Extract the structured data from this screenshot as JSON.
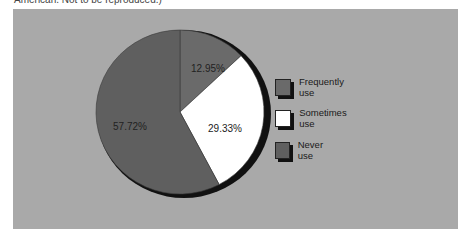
{
  "caption": "American. Not to be reproduced.)",
  "colors": {
    "panel_bg": "#a9a9a9",
    "frequently": "#6a6a6a",
    "sometimes": "#ffffff",
    "never": "#5f5f5f",
    "shadow": "#111111"
  },
  "chart_data": {
    "type": "pie",
    "title": "",
    "categories": [
      "Frequently use",
      "Sometimes use",
      "Never use"
    ],
    "values": [
      12.95,
      29.33,
      57.72
    ],
    "labels": [
      "12.95%",
      "29.33%",
      "57.72%"
    ],
    "legend_position": "right"
  },
  "legend": {
    "items": [
      {
        "label": "Frequently use",
        "swatch": "#6a6a6a"
      },
      {
        "label": "Sometimes use",
        "swatch": "#ffffff"
      },
      {
        "label": "Never use",
        "swatch": "#5f5f5f"
      }
    ]
  }
}
